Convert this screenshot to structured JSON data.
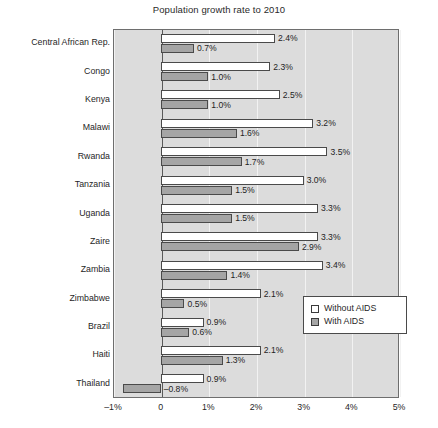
{
  "chart_data": {
    "type": "bar",
    "orientation": "horizontal",
    "title": "Population growth rate to 2010",
    "xlabel": "",
    "ylabel": "",
    "xlim": [
      -1,
      5
    ],
    "xticks": [
      "–1%",
      "0",
      "1%",
      "2%",
      "3%",
      "4%",
      "5%"
    ],
    "xtick_values": [
      -1,
      0,
      1,
      2,
      3,
      4,
      5
    ],
    "grid": true,
    "grid_axis": "x",
    "legend_position": "lower-right",
    "categories": [
      "Central African Rep.",
      "Congo",
      "Kenya",
      "Malawi",
      "Rwanda",
      "Tanzania",
      "Uganda",
      "Zaire",
      "Zambia",
      "Zimbabwe",
      "Brazil",
      "Haiti",
      "Thailand"
    ],
    "series": [
      {
        "name": "Without AIDS",
        "color": "#ffffff",
        "values": [
          2.4,
          2.3,
          2.5,
          3.2,
          3.5,
          3.0,
          3.3,
          3.3,
          3.4,
          2.1,
          0.9,
          2.1,
          0.9
        ],
        "labels": [
          "2.4%",
          "2.3%",
          "2.5%",
          "3.2%",
          "3.5%",
          "3.0%",
          "3.3%",
          "3.3%",
          "3.4%",
          "2.1%",
          "0.9%",
          "2.1%",
          "0.9%"
        ]
      },
      {
        "name": "With AIDS",
        "color": "#a5a5a5",
        "values": [
          0.7,
          1.0,
          1.0,
          1.6,
          1.7,
          1.5,
          1.5,
          2.9,
          1.4,
          0.5,
          0.6,
          1.3,
          -0.8
        ],
        "labels": [
          "0.7%",
          "1.0%",
          "1.0%",
          "1.6%",
          "1.7%",
          "1.5%",
          "1.5%",
          "2.9%",
          "1.4%",
          "0.5%",
          "0.6%",
          "1.3%",
          "–0.8%"
        ]
      }
    ]
  }
}
